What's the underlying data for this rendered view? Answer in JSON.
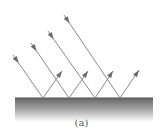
{
  "figure": {
    "label": "(a)",
    "surface": {
      "x": 15,
      "y": 98,
      "width": 138,
      "height": 24,
      "color_top": "#666666",
      "color_bottom": "#ffffff"
    },
    "ray_color": "#8a8a8a",
    "arrow_color": "#6a6a6a",
    "rays": [
      {
        "incident_start": [
          13,
          55
        ],
        "hit": [
          43,
          98
        ],
        "reflected_end": [
          62,
          71
        ]
      },
      {
        "incident_start": [
          31,
          43
        ],
        "hit": [
          69,
          98
        ],
        "reflected_end": [
          88,
          71
        ]
      },
      {
        "incident_start": [
          48,
          31
        ],
        "hit": [
          95,
          98
        ],
        "reflected_end": [
          113,
          71
        ]
      },
      {
        "incident_start": [
          64,
          15
        ],
        "hit": [
          120,
          98
        ],
        "reflected_end": [
          139,
          70
        ]
      }
    ]
  }
}
